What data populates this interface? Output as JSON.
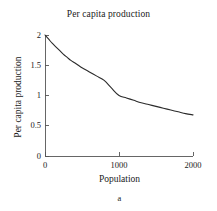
{
  "chart_data": {
    "type": "line",
    "title": "Per capita production",
    "xlabel": "Population",
    "ylabel": "Per capita production",
    "caption": "a",
    "xlim": [
      0,
      2000
    ],
    "ylim": [
      0,
      2
    ],
    "grid": false,
    "legend": null,
    "xticks": [
      {
        "value": 0,
        "label": "0"
      },
      {
        "value": 1000,
        "label": "1000"
      },
      {
        "value": 2000,
        "label": "2000"
      }
    ],
    "yticks": [
      {
        "value": 0,
        "label": "0"
      },
      {
        "value": 0.5,
        "label": "0.5"
      },
      {
        "value": 1,
        "label": "1"
      },
      {
        "value": 1.5,
        "label": "1.5"
      },
      {
        "value": 2,
        "label": "2"
      }
    ],
    "line_color": "#2b2b2b",
    "line_width": 1.1,
    "axis_color": "#555555",
    "background": "#ffffff",
    "series": [
      {
        "name": "Per capita production",
        "x": [
          0,
          50,
          100,
          150,
          200,
          250,
          300,
          350,
          400,
          450,
          500,
          600,
          700,
          800,
          900,
          1000,
          1100,
          1200,
          1300,
          1400,
          1500,
          1600,
          1700,
          1800,
          1900,
          2000
        ],
        "values": [
          2.0,
          1.93,
          1.86,
          1.8,
          1.74,
          1.68,
          1.63,
          1.58,
          1.54,
          1.5,
          1.46,
          1.39,
          1.32,
          1.25,
          1.12,
          1.0,
          0.96,
          0.92,
          0.88,
          0.85,
          0.82,
          0.79,
          0.76,
          0.73,
          0.7,
          0.68
        ]
      }
    ]
  }
}
